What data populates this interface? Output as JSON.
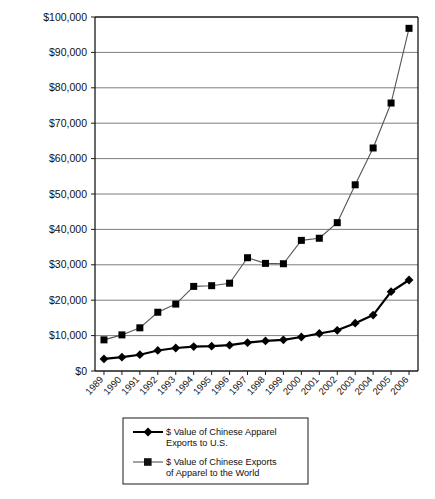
{
  "chart_data": {
    "type": "line",
    "title": "",
    "xlabel": "",
    "ylabel": "",
    "grid": true,
    "legend_position": "bottom-center",
    "ylim": [
      0,
      100000
    ],
    "ytick_values": [
      0,
      10000,
      20000,
      30000,
      40000,
      50000,
      60000,
      70000,
      80000,
      90000,
      100000
    ],
    "ytick_labels": [
      "$0",
      "$10,000",
      "$20,000",
      "$30,000",
      "$40,000",
      "$50,000",
      "$60,000",
      "$70,000",
      "$80,000",
      "$90,000",
      "$100,000"
    ],
    "categories": [
      "1989",
      "1990",
      "1991",
      "1992",
      "1993",
      "1994",
      "1995",
      "1996",
      "1997",
      "1998",
      "1999",
      "2000",
      "2001",
      "2002",
      "2003",
      "2004",
      "2005",
      "2006"
    ],
    "series": [
      {
        "name": "$ Value of Chinese Apparel Exports to U.S.",
        "marker": "diamond",
        "color": "#000000",
        "values": [
          3400,
          3900,
          4600,
          5800,
          6500,
          6900,
          7000,
          7300,
          8000,
          8500,
          8800,
          9600,
          10600,
          11500,
          13500,
          15800,
          22400,
          25700
        ]
      },
      {
        "name": "$ Value of Chinese Exports of Apparel to the World",
        "marker": "square",
        "color": "#000000",
        "values": [
          8800,
          10200,
          12200,
          16600,
          18900,
          23900,
          24100,
          24800,
          32000,
          30400,
          30300,
          36900,
          37500,
          41900,
          52600,
          63000,
          75700,
          96800
        ]
      }
    ]
  },
  "legend": {
    "entries": [
      {
        "label_line1": "$ Value of Chinese Apparel",
        "label_line2": "Exports to U.S.",
        "marker": "diamond"
      },
      {
        "label_line1": "$ Value of Chinese Exports",
        "label_line2": "of Apparel to the World",
        "marker": "square"
      }
    ]
  },
  "colors": {
    "axis": "#1a1a1a",
    "grid": "#6e6e6e",
    "series_line": "#000000",
    "background": "#ffffff"
  }
}
